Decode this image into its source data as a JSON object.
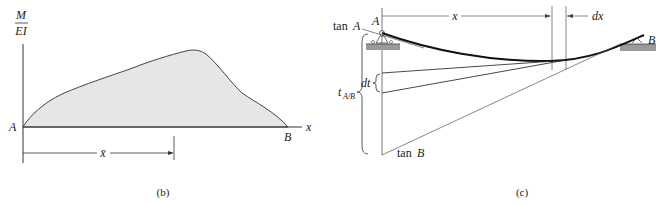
{
  "figure_b": {
    "caption": "(b)",
    "y_axis_label_top": "M",
    "y_axis_label_bottom": "EI",
    "x_axis_label": "x",
    "point_start": "A",
    "point_end": "B",
    "centroid_label": "x̄",
    "fill_color": "#e6e6e6",
    "stroke_color": "#333333"
  },
  "figure_c": {
    "caption": "(c)",
    "point_a": "A",
    "point_b": "B",
    "tan_a_prefix": "tan",
    "tan_a_var": "A",
    "tan_b_prefix": "tan",
    "tan_b_var": "B",
    "dim_x": "x",
    "dim_dx": "dx",
    "dt_label": "dt",
    "t_ab_label": "t",
    "t_ab_sub": "A/B",
    "support_color": "#9a9a9a"
  }
}
